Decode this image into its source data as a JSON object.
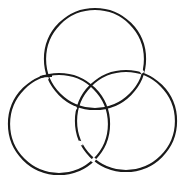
{
  "diagram": {
    "type": "borromean-rings",
    "stroke_color": "#1a1a1a",
    "background": "#ffffff",
    "rings": [
      {
        "name": "top",
        "cx": 95,
        "cy": 59,
        "r": 50
      },
      {
        "name": "left",
        "cx": 59,
        "cy": 124,
        "r": 50
      },
      {
        "name": "right",
        "cx": 126,
        "cy": 121,
        "r": 50
      }
    ]
  }
}
